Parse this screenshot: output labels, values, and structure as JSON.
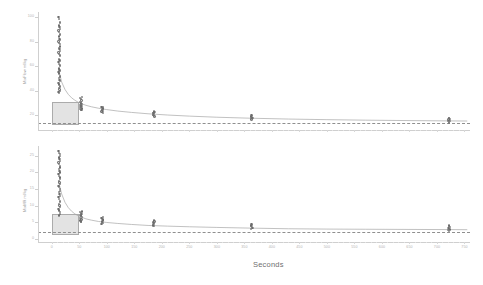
{
  "chart_data": [
    {
      "type": "scatter",
      "panel": "top",
      "title": "",
      "xlabel": "",
      "ylabel": "MixFlow ml/kg",
      "xlim": [
        -25,
        760
      ],
      "ylim": [
        8,
        104
      ],
      "xticks": [
        0,
        50,
        100,
        150,
        200,
        250,
        300,
        350,
        400,
        450,
        500,
        550,
        600,
        650,
        700,
        750
      ],
      "yticks": [
        20,
        40,
        60,
        80,
        100
      ],
      "grid": false,
      "legend": "none",
      "reference_line_y": 14,
      "shaded_region": {
        "x0": 0,
        "x1": 50,
        "y0": 12,
        "y1": 31
      },
      "fit_curve": {
        "description": "decaying curve through cluster medians",
        "x": [
          12,
          18,
          24,
          30,
          36,
          42,
          48,
          54,
          62,
          72,
          85,
          100,
          120,
          145,
          175,
          210,
          250,
          300,
          360,
          430,
          500,
          570,
          640,
          720,
          755
        ],
        "y": [
          58,
          47,
          41,
          37,
          34.2,
          32.2,
          30.6,
          29.4,
          28.1,
          26.9,
          25.7,
          24.6,
          23.4,
          22.3,
          21.2,
          20.2,
          19.3,
          18.4,
          17.6,
          16.9,
          16.4,
          16.0,
          15.7,
          15.4,
          15.3
        ]
      },
      "clusters": [
        {
          "x": 14,
          "values": [
            100,
            98,
            96,
            95,
            93,
            92,
            90,
            89,
            88,
            86,
            85,
            84,
            82,
            81,
            80,
            79,
            78,
            76,
            75,
            74,
            72,
            71,
            70,
            69,
            68,
            66,
            65,
            64,
            63,
            62,
            61,
            60,
            58,
            57,
            56,
            55,
            54,
            52,
            51,
            50,
            49,
            48,
            46,
            45,
            44,
            43,
            42,
            41,
            40,
            39,
            38
          ]
        },
        {
          "x": 53,
          "values": [
            35,
            34,
            33,
            32,
            31,
            30,
            29.5,
            29,
            28.5,
            28,
            27.5,
            27,
            26.5,
            26,
            25.5,
            25,
            24.5,
            24
          ]
        },
        {
          "x": 92,
          "values": [
            27,
            26.5,
            26,
            25.5,
            25,
            24.5,
            24,
            23.5,
            23,
            22.5,
            22
          ]
        },
        {
          "x": 185,
          "values": [
            23,
            22.5,
            22,
            21.5,
            21,
            20.5,
            20,
            19.5,
            19
          ]
        },
        {
          "x": 363,
          "values": [
            20,
            19.5,
            19,
            18.5,
            18,
            17.5,
            17,
            16.5
          ]
        },
        {
          "x": 722,
          "values": [
            18,
            17.5,
            17,
            16.5,
            16,
            15.5,
            15,
            14.5,
            14
          ]
        }
      ]
    },
    {
      "type": "scatter",
      "panel": "bottom",
      "title": "",
      "xlabel": "Seconds",
      "ylabel": "MixMR ml/kg",
      "xlim": [
        -25,
        760
      ],
      "ylim": [
        -1,
        28
      ],
      "xticks": [
        0,
        50,
        100,
        150,
        200,
        250,
        300,
        350,
        400,
        450,
        500,
        550,
        600,
        650,
        700,
        750
      ],
      "yticks": [
        0,
        5,
        10,
        15,
        20,
        25
      ],
      "grid": false,
      "legend": "none",
      "reference_line_y": 2.0,
      "shaded_region": {
        "x0": 0,
        "x1": 50,
        "y0": 1.2,
        "y1": 7.5
      },
      "fit_curve": {
        "description": "decaying curve through cluster medians",
        "x": [
          12,
          18,
          24,
          30,
          36,
          42,
          48,
          54,
          62,
          72,
          85,
          100,
          120,
          145,
          175,
          210,
          250,
          300,
          360,
          430,
          500,
          570,
          640,
          720,
          755
        ],
        "y": [
          17.5,
          13.5,
          11.0,
          9.4,
          8.3,
          7.5,
          6.9,
          6.5,
          6.0,
          5.6,
          5.2,
          4.9,
          4.6,
          4.3,
          4.0,
          3.8,
          3.6,
          3.4,
          3.2,
          3.0,
          2.9,
          2.85,
          2.8,
          2.75,
          2.72
        ]
      },
      "clusters": [
        {
          "x": 14,
          "values": [
            26.5,
            26,
            25.5,
            25,
            24.5,
            24,
            23.5,
            23,
            22.5,
            22,
            21.5,
            21,
            20.5,
            20,
            19.5,
            19,
            18.5,
            18,
            17.5,
            17,
            16.5,
            16,
            15.5,
            15,
            14.5,
            14,
            13.5,
            13,
            12.5,
            12,
            11.5,
            11,
            10.5,
            10,
            9.5,
            9,
            8.5,
            8,
            7.5,
            7
          ]
        },
        {
          "x": 53,
          "values": [
            8.2,
            8,
            7.8,
            7.5,
            7.2,
            7,
            6.8,
            6.5,
            6.2,
            6,
            5.8,
            5.5,
            5.2,
            5
          ]
        },
        {
          "x": 92,
          "values": [
            6.5,
            6.2,
            6,
            5.8,
            5.5,
            5.2,
            5,
            4.8,
            4.5
          ]
        },
        {
          "x": 185,
          "values": [
            5.5,
            5.2,
            5,
            4.8,
            4.5,
            4.2,
            4,
            3.8
          ]
        },
        {
          "x": 363,
          "values": [
            4.5,
            4.2,
            4,
            3.8,
            3.5,
            3.2,
            3
          ]
        },
        {
          "x": 722,
          "values": [
            4.0,
            3.8,
            3.5,
            3.2,
            3,
            2.8,
            2.6,
            2.4
          ]
        }
      ]
    }
  ],
  "figure": {
    "xlabel": "Seconds",
    "top_ylabel": "MixFlow ml/kg",
    "bottom_ylabel": "MixMR ml/kg",
    "top_yticks": [
      "100",
      "80",
      "60",
      "40",
      "20"
    ],
    "bottom_yticks": [
      "25",
      "20",
      "15",
      "10",
      "5",
      "0"
    ],
    "xticks": [
      "0",
      "50",
      "100",
      "150",
      "200",
      "250",
      "300",
      "350",
      "400",
      "450",
      "500",
      "550",
      "600",
      "650",
      "700",
      "750"
    ],
    "colors": {
      "marker": "#6d6d6d",
      "curve": "#a6a6a6",
      "shade_fill": "#d9d9d9",
      "shade_border": "#8c8c8c",
      "refline": "#8f8f8f",
      "axis": "#cfcfcf",
      "ticklabel": "#b3b3b3",
      "axis_title": "#6f6f6f"
    }
  }
}
